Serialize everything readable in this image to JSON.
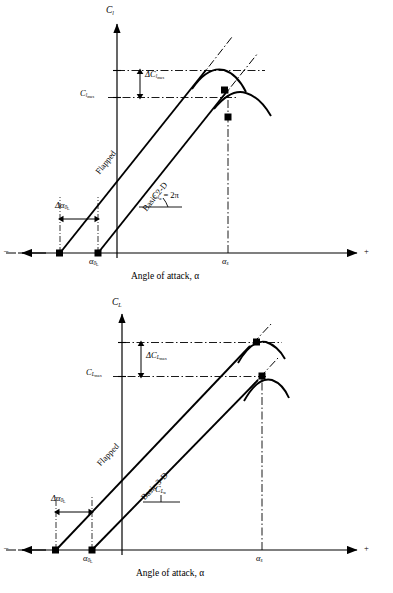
{
  "figure": {
    "type": "technical-diagram",
    "panels": [
      {
        "id": "panel-top",
        "y_axis_label": "C",
        "y_axis_sub": "l",
        "x_axis_caption": "Angle of attack, α",
        "x_axis_negative_sign": "–",
        "x_axis_positive_sign": "+",
        "curve_basic_label": "Basic 2-D",
        "curve_flapped_label": "Flapped",
        "delta_clmax_label": "ΔC",
        "delta_clmax_sub": "l",
        "delta_clmax_subsub": "max",
        "clmax_label": "C",
        "clmax_sub": "l",
        "clmax_subsub": "max",
        "slope_label": "C",
        "slope_sub": "l",
        "slope_subsub": "α",
        "slope_value": "= 2π",
        "delta_alpha_label": "Δα",
        "delta_alpha_sub": "0",
        "delta_alpha_subsub": "L",
        "alpha0L_label": "α",
        "alpha0L_sub": "0",
        "alpha0L_subsub": "L",
        "alpha_stall_label": "α",
        "alpha_stall_sub": "s"
      },
      {
        "id": "panel-bottom",
        "y_axis_label": "C",
        "y_axis_sub": "L",
        "x_axis_caption": "Angle of attack, α",
        "x_axis_negative_sign": "–",
        "x_axis_positive_sign": "+",
        "curve_basic_label": "Basic 3-D",
        "curve_flapped_label": "Flapped",
        "delta_clmax_label": "ΔC",
        "delta_clmax_sub": "L",
        "delta_clmax_subsub": "max",
        "clmax_label": "C",
        "clmax_sub": "L",
        "clmax_subsub": "max",
        "slope_label": "C",
        "slope_sub": "L",
        "slope_subsub": "α",
        "slope_value": "",
        "delta_alpha_label": "Δα",
        "delta_alpha_sub": "0",
        "delta_alpha_subsub": "L",
        "alpha0L_label": "α",
        "alpha0L_sub": "0",
        "alpha0L_subsub": "L",
        "alpha_stall_label": "α",
        "alpha_stall_sub": "s"
      }
    ],
    "colors": {
      "line": "#000000",
      "background": "#ffffff",
      "marker": "#000000"
    }
  }
}
